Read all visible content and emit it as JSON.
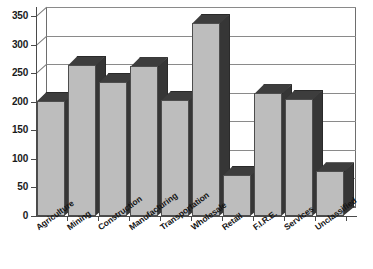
{
  "chart_data": {
    "type": "bar",
    "title": "",
    "subtitle": "",
    "xlabel": "",
    "ylabel": "",
    "ylim": [
      0,
      350
    ],
    "yticks": [
      0,
      50,
      100,
      150,
      200,
      250,
      300,
      350
    ],
    "ytick_labels": [
      "0",
      "50",
      "100",
      "150",
      "200",
      "250",
      "300",
      "350"
    ],
    "grid": true,
    "legend": null,
    "style": "3d-column",
    "categories": [
      "Agriculture",
      "Mining",
      "Construction",
      "Manufacturing",
      "Transportation",
      "Wholesale",
      "Retail",
      "F.I.R.E.",
      "Services",
      "Unclassified"
    ],
    "values": [
      202,
      265,
      235,
      262,
      203,
      338,
      72,
      215,
      205,
      78
    ],
    "colors": {
      "bar_front": "#bdbdbd",
      "bar_top": "#3d3d3d",
      "bar_side": "#363636",
      "bar_outline": "#4d4d4d",
      "axis": "#4a4a4a",
      "gridline": "#8a8a8a",
      "background": "#ffffff",
      "text": "#141414"
    }
  }
}
